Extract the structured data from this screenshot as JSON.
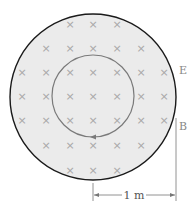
{
  "diagram": {
    "colors": {
      "region_fill": "#ebebeb",
      "outer_circle_stroke": "#1a1a1a",
      "inner_loop_stroke": "#7a7a7a",
      "field_mark": "#a8a8a8",
      "label": "#888888",
      "dimension": "#555555"
    },
    "field_region": {
      "cx": 93,
      "cy": 97,
      "r": 83
    },
    "loop": {
      "cx": 93,
      "cy": 96,
      "r": 41,
      "arrow_direction": "counterclockwise"
    },
    "field_symbol": "×",
    "field_rows": [
      {
        "y": 24,
        "xs": [
          70,
          93,
          117
        ]
      },
      {
        "y": 48,
        "xs": [
          46,
          70,
          93,
          117,
          141
        ]
      },
      {
        "y": 72,
        "xs": [
          22,
          46,
          70,
          93,
          117,
          141,
          164
        ]
      },
      {
        "y": 96,
        "xs": [
          22,
          46,
          70,
          93,
          117,
          141,
          164
        ]
      },
      {
        "y": 120,
        "xs": [
          22,
          46,
          70,
          93,
          117,
          141,
          164
        ]
      },
      {
        "y": 145,
        "xs": [
          46,
          70,
          93,
          117,
          141
        ]
      },
      {
        "y": 170,
        "xs": [
          70,
          93,
          117
        ]
      }
    ],
    "labels": {
      "E": "E",
      "B": "B"
    },
    "dimension": {
      "label": "1 m",
      "x_start": 93,
      "x_end": 176,
      "y": 195
    }
  }
}
